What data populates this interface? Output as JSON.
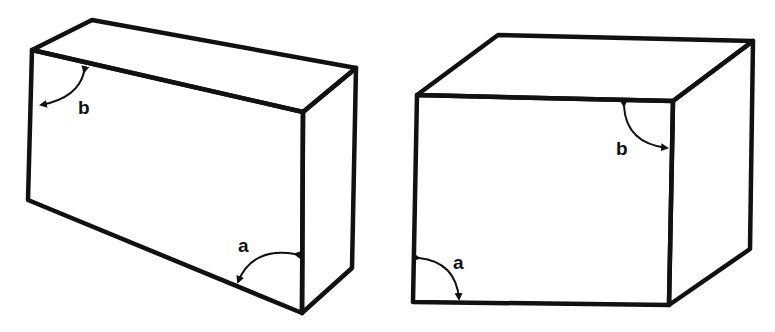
{
  "figures": [
    {
      "id": "left-box",
      "description": "Wide rectangular box in perspective",
      "faces": {
        "top": [
          [
            32,
            50
          ],
          [
            92,
            20
          ],
          [
            356,
            68
          ],
          [
            303,
            112
          ]
        ],
        "front": [
          [
            32,
            50
          ],
          [
            303,
            112
          ],
          [
            302,
            313
          ],
          [
            28,
            200
          ]
        ],
        "side": [
          [
            303,
            112
          ],
          [
            356,
            68
          ],
          [
            352,
            268
          ],
          [
            302,
            313
          ]
        ]
      },
      "angles": [
        {
          "label": "b",
          "arc_from": [
            86,
            63
          ],
          "arc_to": [
            38,
            105
          ],
          "ctrl": [
            80,
            98
          ],
          "label_pos": [
            78,
            114
          ]
        },
        {
          "label": "a",
          "arc_from": [
            297,
            254
          ],
          "arc_to": [
            237,
            288
          ],
          "ctrl": [
            252,
            248
          ],
          "label_pos": [
            238,
            251
          ]
        }
      ]
    },
    {
      "id": "right-box",
      "description": "Cube-like box in perspective",
      "faces": {
        "top": [
          [
            417,
            95
          ],
          [
            498,
            35
          ],
          [
            753,
            41
          ],
          [
            673,
            101
          ]
        ],
        "front": [
          [
            417,
            95
          ],
          [
            673,
            101
          ],
          [
            669,
            305
          ],
          [
            413,
            302
          ]
        ],
        "side": [
          [
            673,
            101
          ],
          [
            753,
            41
          ],
          [
            750,
            249
          ],
          [
            669,
            305
          ]
        ]
      },
      "angles": [
        {
          "label": "b",
          "arc_from": [
            624,
            103
          ],
          "arc_to": [
            670,
            148
          ],
          "ctrl": [
            628,
            146
          ],
          "label_pos": [
            617,
            154
          ]
        },
        {
          "label": "a",
          "arc_from": [
            417,
            258
          ],
          "arc_to": [
            459,
            302
          ],
          "ctrl": [
            457,
            262
          ],
          "label_pos": [
            453,
            268
          ]
        }
      ]
    }
  ],
  "labels": {
    "left_b": "b",
    "left_a": "a",
    "right_b": "b",
    "right_a": "a"
  },
  "colors": {
    "line": "#111111",
    "background": "#ffffff"
  }
}
